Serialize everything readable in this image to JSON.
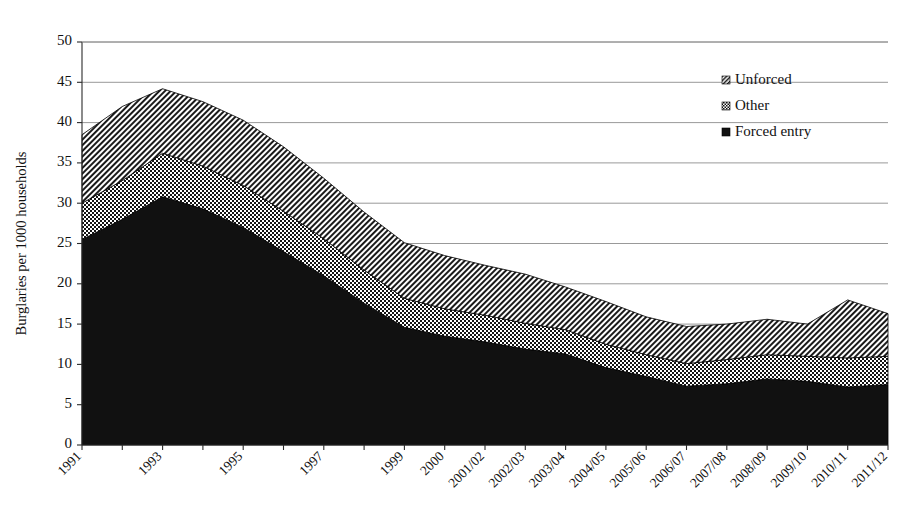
{
  "chart_data": {
    "type": "area",
    "stacked": true,
    "title": "",
    "subtitle": "",
    "xlabel": "",
    "ylabel": "Burglaries per 1000 households",
    "ylim": [
      0,
      50
    ],
    "ytick_step": 5,
    "yticks": [
      "0",
      "5",
      "10",
      "15",
      "20",
      "25",
      "30",
      "35",
      "40",
      "45",
      "50"
    ],
    "grid": true,
    "grid_axis": "y",
    "legend_position": "top-right",
    "categories": [
      "1991",
      "1992",
      "1993",
      "1994",
      "1995",
      "1996",
      "1997",
      "1998",
      "1999",
      "2000",
      "2001/02",
      "2002/03",
      "2003/04",
      "2004/05",
      "2005/06",
      "2006/07",
      "2007/08",
      "2008/09",
      "2009/10",
      "2010/11",
      "2011/12"
    ],
    "xtick_labels_shown": [
      "1991",
      "1993",
      "1995",
      "1997",
      "1999",
      "2000",
      "2001/02",
      "2002/03",
      "2003/04",
      "2004/05",
      "2005/06",
      "2006/07",
      "2007/08",
      "2008/09",
      "2009/10",
      "2010/11",
      "2011/12"
    ],
    "series": [
      {
        "name": "Forced entry",
        "pattern": "solid",
        "color": "#111111",
        "values": [
          25.5,
          28.0,
          30.8,
          29.3,
          27.0,
          24.0,
          21.0,
          17.6,
          14.6,
          13.5,
          12.8,
          11.9,
          11.3,
          9.6,
          8.5,
          7.3,
          7.6,
          8.2,
          7.9,
          7.2,
          7.5
        ]
      },
      {
        "name": "Other",
        "pattern": "checkerboard",
        "color": "#8a8a8a",
        "values": [
          4.5,
          4.8,
          5.4,
          5.3,
          5.2,
          5.0,
          4.6,
          4.1,
          3.6,
          3.4,
          3.3,
          3.2,
          3.0,
          2.9,
          2.7,
          2.8,
          3.0,
          3.0,
          3.1,
          3.6,
          3.5
        ]
      },
      {
        "name": "Unforced",
        "pattern": "diagonal-hatch",
        "color": "#b9b9b9",
        "values": [
          8.5,
          9.2,
          8.0,
          8.0,
          8.1,
          8.0,
          7.5,
          7.2,
          6.9,
          6.6,
          6.2,
          6.1,
          5.3,
          5.3,
          4.7,
          4.6,
          4.4,
          4.4,
          4.0,
          7.2,
          5.3
        ]
      }
    ],
    "totals": [
      38.5,
      42.0,
      44.2,
      42.6,
      40.3,
      37.0,
      33.1,
      28.9,
      25.1,
      23.5,
      22.3,
      21.2,
      19.6,
      17.8,
      15.9,
      14.7,
      15.0,
      15.6,
      15.0,
      18.0,
      16.3
    ],
    "legend": [
      {
        "label": "Unforced",
        "pattern": "diagonal-hatch"
      },
      {
        "label": "Other",
        "pattern": "checkerboard"
      },
      {
        "label": "Forced entry",
        "pattern": "solid"
      }
    ]
  },
  "colors": {
    "forced_entry": "#111111",
    "other": "#8a8a8a",
    "unforced": "#b9b9b9",
    "axis": "#2b2b2b",
    "grid": "#8d8d8d",
    "background": "#ffffff"
  }
}
